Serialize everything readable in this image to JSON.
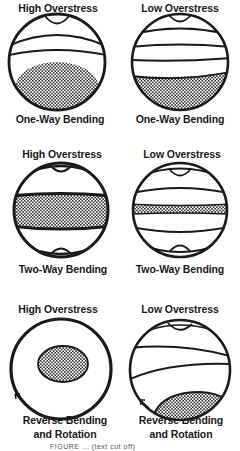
{
  "figure": {
    "rows": [
      {
        "panels": [
          {
            "top_label": "High Overstress",
            "bottom_label": "One-Way Bending"
          },
          {
            "top_label": "Low Overstress",
            "bottom_label": "One-Way Bending"
          }
        ]
      },
      {
        "panels": [
          {
            "top_label": "High Overstress",
            "bottom_label": "Two-Way Bending"
          },
          {
            "top_label": "Low Overstress",
            "bottom_label": "Two-Way Bending"
          }
        ]
      },
      {
        "panels": [
          {
            "top_label": "High Overstress",
            "bottom_label_line1": "Reverse Bending",
            "bottom_label_line2": "and Rotation"
          },
          {
            "top_label": "Low Overstress",
            "bottom_label_line1": "Reverse Bending",
            "bottom_label_line2": "and Rotation"
          }
        ]
      }
    ],
    "caption": "FIGURE ... (text cut off)",
    "colors": {
      "ink": "#1a1a1a",
      "background": "#ffffff",
      "stipple": "#1a1a1a"
    }
  }
}
